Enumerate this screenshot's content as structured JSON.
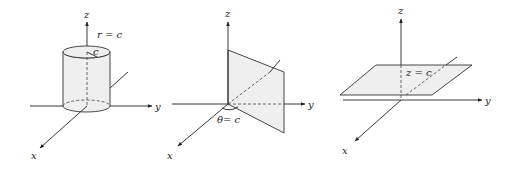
{
  "figure": {
    "panels": [
      {
        "name": "cylinder",
        "axes": {
          "x": "x",
          "y": "y",
          "z": "z"
        },
        "surface_label": "r = c",
        "radius_label": "c"
      },
      {
        "name": "half-plane",
        "axes": {
          "x": "x",
          "y": "y",
          "z": "z"
        },
        "surface_label": "θ= c"
      },
      {
        "name": "horizontal-plane",
        "axes": {
          "x": "x",
          "y": "y",
          "z": "z"
        },
        "surface_label": "z = c"
      }
    ],
    "colors": {
      "line": "#222222",
      "surface_fill": "#efefef",
      "background": "#ffffff"
    }
  }
}
